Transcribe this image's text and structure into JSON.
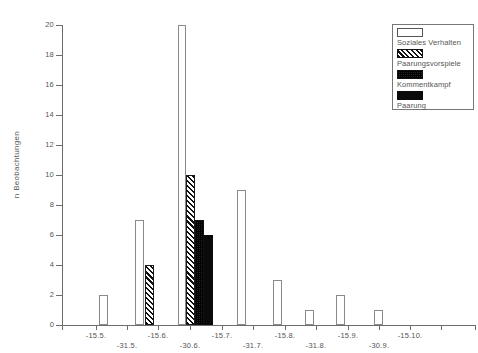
{
  "chart_data": {
    "type": "bar",
    "title": "",
    "xlabel": "",
    "ylabel": "n Beobachtungen",
    "ylim": [
      0,
      20
    ],
    "ytick_labels": [
      "0",
      "2",
      "4",
      "6",
      "8",
      "10",
      "12",
      "14",
      "16",
      "18",
      "20"
    ],
    "ytick_values": [
      0,
      2,
      4,
      6,
      8,
      10,
      12,
      14,
      16,
      18,
      20
    ],
    "grid": false,
    "legend_position": "top-right",
    "xtick_labels_upper": [
      "-15.5.",
      "-15.6.",
      "-15.7.",
      "-15.8.",
      "-15.9.",
      "-15.10."
    ],
    "xtick_labels_lower": [
      "-31.5.",
      "-30.6.",
      "-31.7.",
      "-31.8.",
      "-30.9."
    ],
    "series": [
      {
        "name": "Soziales Verhalten",
        "pattern": "open"
      },
      {
        "name": "Paarungsvorspiele",
        "pattern": "hatch"
      },
      {
        "name": "Kommentkampf",
        "pattern": "dots"
      },
      {
        "name": "Paarung",
        "pattern": "solid"
      }
    ],
    "bars": [
      {
        "x_px": 37,
        "value": 2,
        "pattern": "open",
        "width_px": 9
      },
      {
        "x_px": 73,
        "value": 7,
        "pattern": "open",
        "width_px": 9
      },
      {
        "x_px": 83,
        "value": 4,
        "pattern": "hatch",
        "width_px": 9
      },
      {
        "x_px": 116,
        "value": 20,
        "pattern": "open",
        "width_px": 8
      },
      {
        "x_px": 124,
        "value": 10,
        "pattern": "hatch",
        "width_px": 9
      },
      {
        "x_px": 133,
        "value": 7,
        "pattern": "dots",
        "width_px": 9
      },
      {
        "x_px": 142,
        "value": 6,
        "pattern": "solid",
        "width_px": 9
      },
      {
        "x_px": 175,
        "value": 9,
        "pattern": "open",
        "width_px": 9
      },
      {
        "x_px": 211,
        "value": 3,
        "pattern": "open",
        "width_px": 9
      },
      {
        "x_px": 243,
        "value": 1,
        "pattern": "open",
        "width_px": 9
      },
      {
        "x_px": 274,
        "value": 2,
        "pattern": "open",
        "width_px": 9
      },
      {
        "x_px": 312,
        "value": 1,
        "pattern": "open",
        "width_px": 9
      }
    ]
  },
  "legend": {
    "items": [
      {
        "label": "Soziales Verhalten",
        "pattern": "open"
      },
      {
        "label": "Paarungsvorspiele",
        "pattern": "hatch"
      },
      {
        "label": "Kommentkampf",
        "pattern": "dots"
      },
      {
        "label": "Paarung",
        "pattern": "solid"
      }
    ]
  },
  "axes": {
    "y_title": "n Beobachtungen"
  }
}
